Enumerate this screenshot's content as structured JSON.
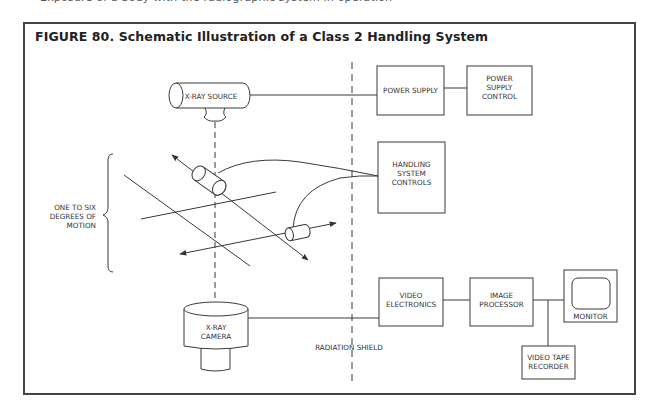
{
  "page": {
    "top_cut_text": "Exposure of a body with the radiographic system in operation"
  },
  "figure": {
    "title": "FIGURE 80. Schematic Illustration of a Class 2 Handling System",
    "number": "80",
    "colors": {
      "line": "#3a3a3a",
      "frame": "#444444",
      "background": "#ffffff"
    }
  },
  "diagram": {
    "nodes": {
      "xray_source": {
        "label": "X-RAY SOURCE",
        "shape": "horizontal-cylinder"
      },
      "power_supply": {
        "label_lines": [
          "POWER SUPPLY"
        ]
      },
      "power_supply_control": {
        "label_lines": [
          "POWER",
          "SUPPLY",
          "CONTROL"
        ]
      },
      "handling_controls": {
        "label_lines": [
          "HANDLING",
          "SYSTEM",
          "CONTROLS"
        ]
      },
      "xray_camera": {
        "label_lines": [
          "X-RAY",
          "CAMERA"
        ],
        "shape": "vertical-cylinder"
      },
      "video_electronics": {
        "label_lines": [
          "VIDEO",
          "ELECTRONICS"
        ]
      },
      "image_processor": {
        "label_lines": [
          "IMAGE",
          "PROCESSOR"
        ]
      },
      "monitor": {
        "label": "MONITOR",
        "shape": "display"
      },
      "video_tape_recorder": {
        "label_lines": [
          "VIDEO TAPE",
          "RECORDER"
        ]
      }
    },
    "annotations": {
      "motion_label_lines": [
        "ONE TO SIX",
        "DEGREES OF",
        "MOTION"
      ],
      "shield_label": "RADIATION SHIELD"
    },
    "edges": [
      {
        "from": "xray_source",
        "to": "power_supply"
      },
      {
        "from": "power_supply",
        "to": "power_supply_control"
      },
      {
        "from": "handling_controls",
        "to": "manipulator_upper"
      },
      {
        "from": "handling_controls",
        "to": "manipulator_lower"
      },
      {
        "from": "xray_camera",
        "to": "video_electronics"
      },
      {
        "from": "video_electronics",
        "to": "image_processor"
      },
      {
        "from": "image_processor",
        "to": "monitor"
      },
      {
        "from": "image_processor",
        "to": "video_tape_recorder"
      }
    ]
  }
}
